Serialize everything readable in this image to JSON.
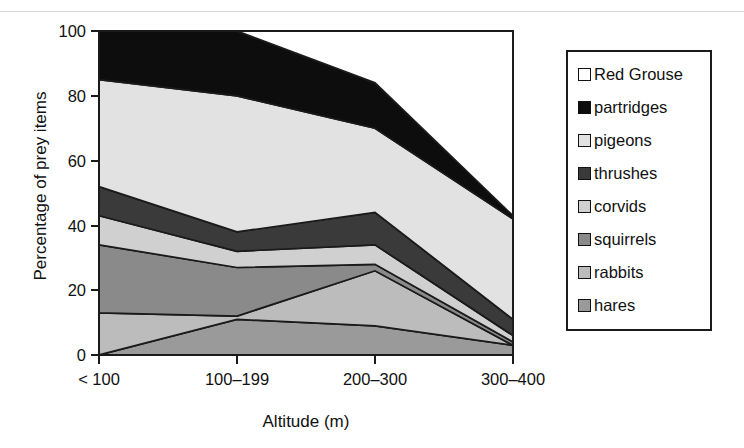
{
  "scan_header": {
    "text": "",
    "visible": false
  },
  "chart_data": {
    "type": "area",
    "stacked": true,
    "title": "",
    "xlabel": "Altitude (m)",
    "ylabel": "Percentage of prey items",
    "categories": [
      "< 100",
      "100–199",
      "200–300",
      "300–400"
    ],
    "ylim": [
      0,
      100
    ],
    "yticks": [
      0,
      20,
      40,
      60,
      80,
      100
    ],
    "ytick_labels": [
      "0",
      "20",
      "40",
      "60",
      "80",
      "100"
    ],
    "grid": false,
    "legend_position": "right",
    "stack_order_bottom_to_top": [
      "hares",
      "rabbits",
      "squirrels",
      "corvids",
      "thrushes",
      "pigeons",
      "partridges",
      "Red Grouse"
    ],
    "series": [
      {
        "name": "Red Grouse",
        "values": [
          0,
          0,
          0,
          0
        ],
        "color": "#ffffff"
      },
      {
        "name": "partridges",
        "values": [
          24,
          20,
          14,
          1
        ],
        "color": "#0d0d0d"
      },
      {
        "name": "pigeons",
        "values": [
          33,
          42,
          26,
          31
        ],
        "color": "#e2e2e2"
      },
      {
        "name": "thrushes",
        "values": [
          9,
          6,
          10,
          5
        ],
        "color": "#3a3a3a"
      },
      {
        "name": "corvids",
        "values": [
          9,
          5,
          6,
          2
        ],
        "color": "#d0d0d0"
      },
      {
        "name": "squirrels",
        "values": [
          21,
          15,
          2,
          1
        ],
        "color": "#8a8a8a"
      },
      {
        "name": "rabbits",
        "values": [
          13,
          1,
          17,
          0
        ],
        "color": "#bcbcbc"
      },
      {
        "name": "hares",
        "values": [
          0,
          11,
          9,
          3
        ],
        "color": "#9a9a9a"
      }
    ],
    "cumulative_tops": {
      "hares": [
        0,
        11,
        9,
        3
      ],
      "rabbits": [
        13,
        12,
        26,
        3
      ],
      "squirrels": [
        34,
        27,
        28,
        4
      ],
      "corvids": [
        43,
        32,
        34,
        6
      ],
      "thrushes": [
        43,
        32,
        44,
        11
      ],
      "pigeons": [
        76,
        74,
        70,
        42
      ],
      "partridges": [
        100,
        80,
        69,
        43
      ],
      "RedGrouse": [
        100,
        100,
        100,
        100
      ]
    }
  },
  "legend": {
    "items": [
      {
        "label": "Red Grouse",
        "color": "#ffffff",
        "swatch": "legend-swatch-red-grouse"
      },
      {
        "label": "partridges",
        "color": "#0d0d0d",
        "swatch": "legend-swatch-partridges"
      },
      {
        "label": "pigeons",
        "color": "#e2e2e2",
        "swatch": "legend-swatch-pigeons"
      },
      {
        "label": "thrushes",
        "color": "#3a3a3a",
        "swatch": "legend-swatch-thrushes"
      },
      {
        "label": "corvids",
        "color": "#d0d0d0",
        "swatch": "legend-swatch-corvids"
      },
      {
        "label": "squirrels",
        "color": "#8a8a8a",
        "swatch": "legend-swatch-squirrels"
      },
      {
        "label": "rabbits",
        "color": "#bcbcbc",
        "swatch": "legend-swatch-rabbits"
      },
      {
        "label": "hares",
        "color": "#9a9a9a",
        "swatch": "legend-swatch-hares"
      }
    ]
  },
  "axes": {
    "y_title": "Percentage of prey items",
    "x_title": "Altitude (m)",
    "y_ticks": [
      "100",
      "80",
      "60",
      "40",
      "20",
      "0"
    ],
    "x_ticks": [
      "< 100",
      "100–199",
      "200–300",
      "300–400"
    ]
  },
  "colors": {
    "frame": "#1a1a1a",
    "background": "#ffffff",
    "text": "#111111"
  }
}
